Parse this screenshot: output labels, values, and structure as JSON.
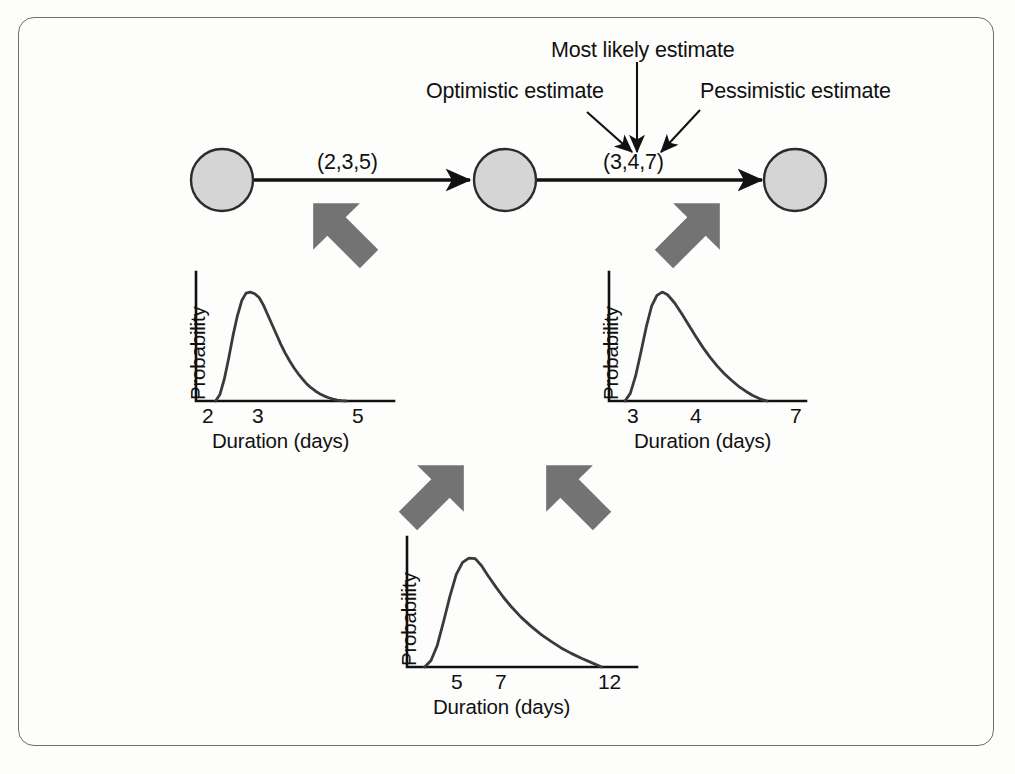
{
  "figure": {
    "background_color": "#fdfdfc",
    "frame_color": "#6e6e6e",
    "node_fill": "#d5d5d5",
    "node_stroke": "#2b2b2b",
    "block_arrow_color": "#737373",
    "line_color": "#111111"
  },
  "annotations": [
    {
      "id": "optimistic",
      "label": "Optimistic estimate"
    },
    {
      "id": "most_likely",
      "label": "Most likely estimate"
    },
    {
      "id": "pessimistic",
      "label": "Pessimistic estimate"
    }
  ],
  "network": {
    "nodes": [
      {
        "id": "n1",
        "label": ""
      },
      {
        "id": "n2",
        "label": ""
      },
      {
        "id": "n3",
        "label": ""
      }
    ],
    "edges": [
      {
        "id": "e1",
        "from": "n1",
        "to": "n2",
        "label": "(2,3,5)",
        "optimistic": 2,
        "most_likely": 3,
        "pessimistic": 5
      },
      {
        "id": "e2",
        "from": "n2",
        "to": "n3",
        "label": "(3,4,7)",
        "optimistic": 3,
        "most_likely": 4,
        "pessimistic": 7
      }
    ]
  },
  "chart_data": [
    {
      "id": "chart-activity-1",
      "type": "line",
      "title": "",
      "xlabel": "Duration (days)",
      "ylabel": "Probability",
      "xticks": [
        2,
        3,
        5
      ],
      "xticklabels": [
        "2",
        "3",
        "5"
      ],
      "xlim": [
        1.55,
        6.1
      ],
      "ylim": [
        0,
        1.12
      ],
      "grid": false,
      "legend": null,
      "distribution": {
        "shape": "beta",
        "min": 2,
        "mode": 3,
        "max": 5
      },
      "x": [
        2.0,
        2.1,
        2.2,
        2.3,
        2.4,
        2.5,
        2.6,
        2.7,
        2.8,
        2.9,
        3.0,
        3.1,
        3.2,
        3.3,
        3.4,
        3.5,
        3.6,
        3.7,
        3.8,
        3.9,
        4.0,
        4.1,
        4.2,
        4.3,
        4.4,
        4.5,
        4.6,
        4.7,
        4.8,
        4.9,
        5.0
      ],
      "y": [
        0.0,
        0.06,
        0.2,
        0.39,
        0.6,
        0.78,
        0.92,
        0.99,
        1.0,
        0.985,
        0.95,
        0.88,
        0.79,
        0.7,
        0.61,
        0.52,
        0.44,
        0.37,
        0.305,
        0.25,
        0.2,
        0.155,
        0.12,
        0.09,
        0.065,
        0.045,
        0.03,
        0.018,
        0.009,
        0.003,
        0.0
      ]
    },
    {
      "id": "chart-activity-2",
      "type": "line",
      "title": "",
      "xlabel": "Duration (days)",
      "ylabel": "Probability",
      "xticks": [
        3,
        4,
        7
      ],
      "xticklabels": [
        "3",
        "4",
        "7"
      ],
      "xlim": [
        2.55,
        8.1
      ],
      "ylim": [
        0,
        1.12
      ],
      "grid": false,
      "legend": null,
      "distribution": {
        "shape": "beta",
        "min": 3,
        "mode": 4,
        "max": 7
      },
      "x": [
        3.0,
        3.15,
        3.3,
        3.45,
        3.6,
        3.75,
        3.9,
        4.05,
        4.2,
        4.4,
        4.6,
        4.8,
        5.0,
        5.2,
        5.4,
        5.6,
        5.8,
        6.0,
        6.2,
        6.4,
        6.6,
        6.8,
        7.0
      ],
      "y": [
        0.0,
        0.07,
        0.23,
        0.45,
        0.68,
        0.87,
        0.97,
        1.0,
        0.975,
        0.9,
        0.8,
        0.695,
        0.59,
        0.49,
        0.4,
        0.32,
        0.25,
        0.19,
        0.135,
        0.09,
        0.05,
        0.02,
        0.0
      ]
    },
    {
      "id": "chart-total",
      "type": "line",
      "title": "",
      "xlabel": "Duration (days)",
      "ylabel": "Probability",
      "xticks": [
        5,
        7,
        12
      ],
      "xticklabels": [
        "5",
        "7",
        "12"
      ],
      "xlim": [
        4.3,
        13.4
      ],
      "ylim": [
        0,
        1.12
      ],
      "grid": false,
      "distribution": {
        "shape": "beta",
        "min": 5,
        "mode": 7,
        "max": 12
      },
      "x": [
        5.0,
        5.25,
        5.5,
        5.75,
        6.0,
        6.25,
        6.5,
        6.75,
        7.0,
        7.25,
        7.5,
        7.8,
        8.1,
        8.4,
        8.8,
        9.2,
        9.6,
        10.0,
        10.4,
        10.8,
        11.2,
        11.6,
        12.0
      ],
      "y": [
        0.0,
        0.06,
        0.2,
        0.42,
        0.65,
        0.85,
        0.96,
        1.0,
        0.995,
        0.93,
        0.84,
        0.74,
        0.645,
        0.56,
        0.46,
        0.375,
        0.3,
        0.235,
        0.175,
        0.125,
        0.08,
        0.04,
        0.0
      ]
    }
  ]
}
